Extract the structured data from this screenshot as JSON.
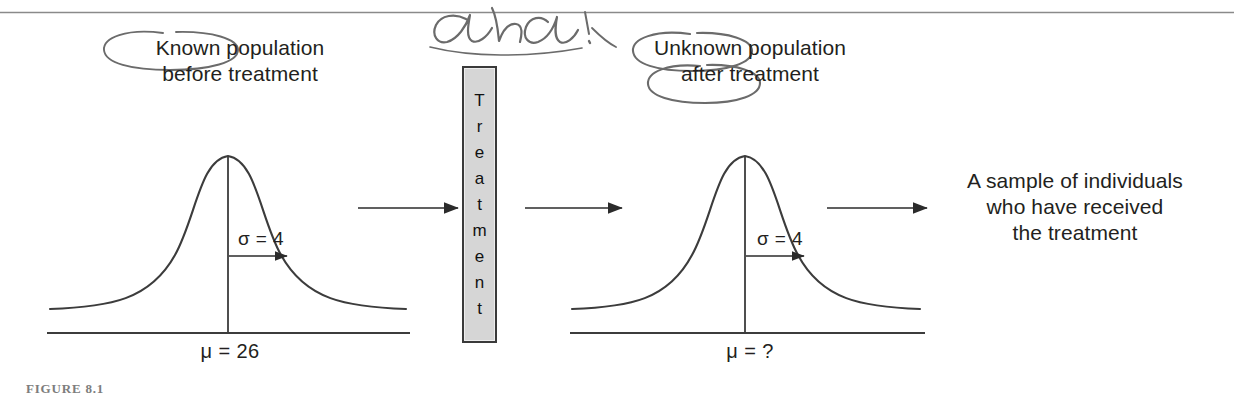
{
  "figure": {
    "caption_label": "FIGURE 8.1",
    "top_rule": true
  },
  "panels": {
    "left_caption": "Known population\nbefore treatment",
    "right_caption": "Unknown population\nafter treatment",
    "sample_caption": "A sample of individuals\nwho have received\nthe treatment"
  },
  "treatment_box": {
    "label": "Treatment",
    "letters": [
      "T",
      "r",
      "e",
      "a",
      "t",
      "m",
      "e",
      "n",
      "t"
    ],
    "fill_color": "#d6d6d6",
    "border_color": "#3a3a3a"
  },
  "distributions": {
    "left": {
      "mean_label": "μ = 26",
      "sigma_label": "σ = 4",
      "mean_value": 26,
      "sigma_value": 4
    },
    "right": {
      "mean_label": "μ = ?",
      "sigma_label": "σ = 4",
      "mean_value": null,
      "sigma_value": 4
    }
  },
  "annotations": {
    "handwritten_note": "ah ha!",
    "circled_words": [
      "Known",
      "Unknown",
      "after"
    ],
    "ink_color": "#6b6b6b"
  },
  "colors": {
    "line": "#3c3c3c",
    "text": "#231f20",
    "rule": "#8a8a8a"
  }
}
